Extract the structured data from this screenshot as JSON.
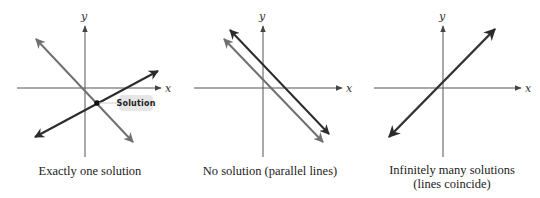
{
  "colors": {
    "axis": "#555555",
    "dark_line": "#2b2b2b",
    "gray_line": "#707070",
    "badge_bg": "#e6e6e6",
    "text": "#222222"
  },
  "panels": [
    {
      "id": "one-solution",
      "x_label": "x",
      "y_label": "y",
      "caption_lines": [
        "Exactly one solution"
      ],
      "badge_label": "Solution"
    },
    {
      "id": "no-solution",
      "x_label": "x",
      "y_label": "y",
      "caption_lines": [
        "No solution (parallel lines)"
      ]
    },
    {
      "id": "infinitely-many",
      "x_label": "x",
      "y_label": "y",
      "caption_lines": [
        "Infinitely many solutions",
        "(lines coincide)"
      ]
    }
  ]
}
